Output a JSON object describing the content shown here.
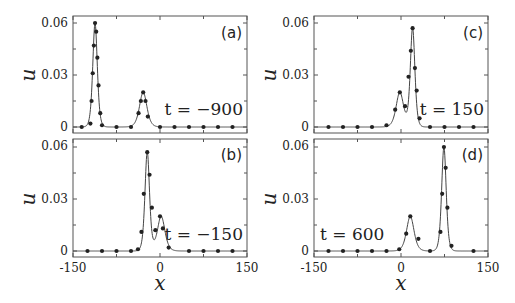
{
  "chart_data": [
    {
      "type": "line",
      "panel": "(a)",
      "annotation": "t = −900",
      "xlabel": "x",
      "ylabel": "u",
      "xlim": [
        -150,
        150
      ],
      "ylim": [
        0,
        0.06
      ],
      "yticks": [
        "0",
        "0.03",
        "0.06"
      ],
      "xticks": [],
      "curve_peaks": [
        {
          "x": -112,
          "u": 0.06
        },
        {
          "x": -29,
          "u": 0.02
        }
      ],
      "points": [
        [
          -135,
          0.0
        ],
        [
          -120,
          0.002
        ],
        [
          -118,
          0.015
        ],
        [
          -116,
          0.031
        ],
        [
          -114,
          0.047
        ],
        [
          -112,
          0.06
        ],
        [
          -110,
          0.055
        ],
        [
          -108,
          0.04
        ],
        [
          -106,
          0.024
        ],
        [
          -103,
          0.008
        ],
        [
          -100,
          0.001
        ],
        [
          -75,
          0.0
        ],
        [
          -50,
          0.0
        ],
        [
          -37,
          0.008
        ],
        [
          -33,
          0.015
        ],
        [
          -29,
          0.02
        ],
        [
          -25,
          0.015
        ],
        [
          -21,
          0.006
        ],
        [
          0,
          0.0
        ],
        [
          25,
          0.0
        ],
        [
          50,
          0.0
        ],
        [
          75,
          0.0
        ],
        [
          100,
          0.0
        ],
        [
          125,
          0.0
        ]
      ]
    },
    {
      "type": "line",
      "panel": "(b)",
      "annotation": "t = −150",
      "xlabel": "x",
      "ylabel": "u",
      "xlim": [
        -150,
        150
      ],
      "ylim": [
        0,
        0.06
      ],
      "yticks": [
        "0",
        "0.03",
        "0.06"
      ],
      "xticks": [
        "-150",
        "0",
        "150"
      ],
      "curve_peaks": [
        {
          "x": -22,
          "u": 0.057
        },
        {
          "x": 2,
          "u": 0.02
        }
      ],
      "points": [
        [
          -125,
          0.0
        ],
        [
          -100,
          0.0
        ],
        [
          -75,
          0.0
        ],
        [
          -50,
          0.0
        ],
        [
          -38,
          0.001
        ],
        [
          -32,
          0.011
        ],
        [
          -28,
          0.033
        ],
        [
          -22,
          0.057
        ],
        [
          -18,
          0.044
        ],
        [
          -14,
          0.025
        ],
        [
          -8,
          0.012
        ],
        [
          0,
          0.02
        ],
        [
          5,
          0.013
        ],
        [
          15,
          0.002
        ],
        [
          50,
          0.0
        ],
        [
          75,
          0.0
        ],
        [
          100,
          0.0
        ],
        [
          125,
          0.0
        ]
      ]
    },
    {
      "type": "line",
      "panel": "(c)",
      "annotation": "t = 150",
      "xlabel": "x",
      "ylabel": "u",
      "xlim": [
        -150,
        150
      ],
      "ylim": [
        0,
        0.06
      ],
      "yticks": [
        "0",
        "0.03",
        "0.06"
      ],
      "xticks": [],
      "curve_peaks": [
        {
          "x": -2,
          "u": 0.02
        },
        {
          "x": 20,
          "u": 0.057
        }
      ],
      "points": [
        [
          -125,
          0.0
        ],
        [
          -100,
          0.0
        ],
        [
          -75,
          0.0
        ],
        [
          -50,
          0.0
        ],
        [
          -25,
          0.001
        ],
        [
          -10,
          0.01
        ],
        [
          -2,
          0.02
        ],
        [
          7,
          0.012
        ],
        [
          13,
          0.029
        ],
        [
          17,
          0.044
        ],
        [
          20,
          0.057
        ],
        [
          24,
          0.034
        ],
        [
          27,
          0.021
        ],
        [
          32,
          0.005
        ],
        [
          50,
          0.0
        ],
        [
          75,
          0.0
        ],
        [
          100,
          0.0
        ],
        [
          125,
          0.0
        ]
      ]
    },
    {
      "type": "line",
      "panel": "(d)",
      "annotation": "t = 600",
      "xlabel": "x",
      "ylabel": "u",
      "xlim": [
        -150,
        150
      ],
      "ylim": [
        0,
        0.06
      ],
      "yticks": [
        "0",
        "0.03",
        "0.06"
      ],
      "xticks": [
        "-150",
        "0",
        "150"
      ],
      "curve_peaks": [
        {
          "x": 16,
          "u": 0.02
        },
        {
          "x": 74,
          "u": 0.06
        }
      ],
      "points": [
        [
          -125,
          0.0
        ],
        [
          -100,
          0.0
        ],
        [
          -75,
          0.0
        ],
        [
          -50,
          0.0
        ],
        [
          -25,
          0.0
        ],
        [
          -3,
          0.001
        ],
        [
          9,
          0.01
        ],
        [
          16,
          0.02
        ],
        [
          30,
          0.007
        ],
        [
          50,
          0.0
        ],
        [
          68,
          0.011
        ],
        [
          71,
          0.033
        ],
        [
          74,
          0.06
        ],
        [
          77,
          0.048
        ],
        [
          80,
          0.025
        ],
        [
          87,
          0.003
        ],
        [
          125,
          0.0
        ]
      ]
    }
  ],
  "labels": {
    "ylabel": "u",
    "xlabel": "x",
    "yticks": [
      "0",
      "0.03",
      "0.06"
    ],
    "xticks": [
      "-150",
      "0",
      "150"
    ],
    "panels": [
      {
        "tag": "(a)",
        "time": "t = −900"
      },
      {
        "tag": "(b)",
        "time": "t = −150"
      },
      {
        "tag": "(c)",
        "time": "t = 150"
      },
      {
        "tag": "(d)",
        "time": "t = 600"
      }
    ]
  }
}
